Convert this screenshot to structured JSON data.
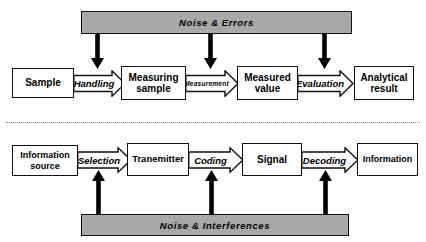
{
  "figure": {
    "colors": {
      "noise_bar_fill": "#a8a8a8",
      "noise_bar_stroke": "#111111",
      "box_fill": "#ffffff",
      "box_stroke": "#111111",
      "arrow_fill": "#ffffff",
      "arrow_stroke": "#111111",
      "vertical_arrow": "#000000",
      "divider": "#8a8a8a",
      "background": "#ffffff"
    }
  },
  "top_section": {
    "noise_bar": {
      "label": "Noise  &  Errors"
    },
    "boxes": [
      {
        "label": "Sample"
      },
      {
        "label": "Measuring\nsample"
      },
      {
        "label": "Measured\nvalue"
      },
      {
        "label": "Analytical\nresult"
      }
    ],
    "arrows": [
      {
        "label": "Handling"
      },
      {
        "label": "Measurement"
      },
      {
        "label": "Evaluation"
      }
    ],
    "down_arrows": [
      {
        "name": "noise-to-handling"
      },
      {
        "name": "noise-to-measurement"
      },
      {
        "name": "noise-to-evaluation"
      }
    ]
  },
  "bottom_section": {
    "noise_bar": {
      "label": "Noise  &  Interferences"
    },
    "boxes": [
      {
        "label": "Information\nsource"
      },
      {
        "label": "Tranemitter"
      },
      {
        "label": "Signal"
      },
      {
        "label": "Information"
      }
    ],
    "arrows": [
      {
        "label": "Selection"
      },
      {
        "label": "Coding"
      },
      {
        "label": "Decoding"
      }
    ],
    "up_arrows": [
      {
        "name": "noise-to-selection"
      },
      {
        "name": "noise-to-coding"
      },
      {
        "name": "noise-to-decoding"
      }
    ]
  }
}
